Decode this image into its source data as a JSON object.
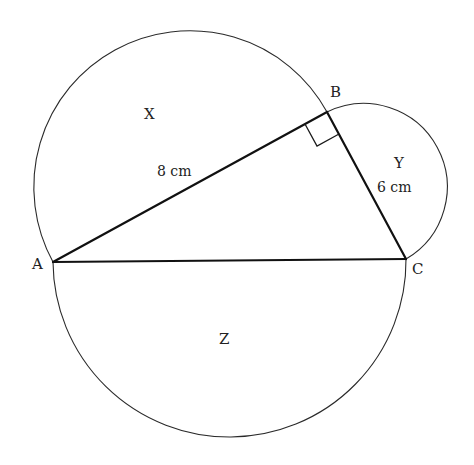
{
  "diagram": {
    "title": "",
    "points": {
      "A": {
        "label": "A"
      },
      "B": {
        "label": "B"
      },
      "C": {
        "label": "C"
      }
    },
    "regions": {
      "X": {
        "label": "X",
        "description": "semicircle on diameter AB"
      },
      "Y": {
        "label": "Y",
        "description": "semicircle on diameter BC"
      },
      "Z": {
        "label": "Z",
        "description": "semicircle on diameter AC"
      }
    },
    "sides": {
      "AB": {
        "length_label": "8 cm"
      },
      "BC": {
        "length_label": "6 cm"
      }
    },
    "right_angle_at": "B",
    "colors": {
      "stroke": "#111111",
      "background": "#ffffff"
    }
  }
}
